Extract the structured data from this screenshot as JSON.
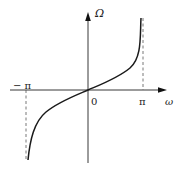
{
  "diagram": {
    "type": "function-plot",
    "axes": {
      "vertical_label": "Ω",
      "horizontal_label": "ω",
      "origin_label": "0"
    },
    "ticks": {
      "neg_pi": "− π",
      "pos_pi": "π"
    },
    "colors": {
      "line": "#1a1a1a",
      "axis": "#222222",
      "dashed": "#555555",
      "background": "#ffffff"
    }
  }
}
